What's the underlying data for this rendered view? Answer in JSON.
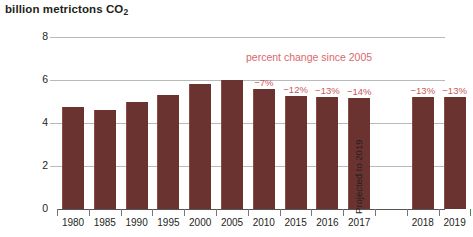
{
  "chart_data": {
    "type": "bar",
    "title": "billion metrictons CO2",
    "title_main": "billion metrictons CO",
    "title_sub": "2",
    "xlabel": "",
    "ylabel": "",
    "ylim": [
      0,
      8
    ],
    "yticks": [
      "0",
      "2",
      "4",
      "6",
      "8"
    ],
    "ytick_values": [
      0,
      2,
      4,
      6,
      8
    ],
    "grid": true,
    "legend": "none",
    "categories": [
      "1980",
      "1985",
      "1990",
      "1995",
      "2000",
      "2005",
      "2010",
      "2015",
      "2016",
      "2017",
      "2018",
      "2019"
    ],
    "values": [
      4.75,
      4.6,
      5.0,
      5.3,
      5.8,
      6.0,
      5.6,
      5.25,
      5.2,
      5.15,
      5.2,
      5.2
    ],
    "annotations": {
      "series_note": "percent change since 2005",
      "projected_note": "Projected to 2019",
      "percent_changes": [
        {
          "category": "2010",
          "label": "-7%"
        },
        {
          "category": "2015",
          "label": "-12%"
        },
        {
          "category": "2016",
          "label": "-13%"
        },
        {
          "category": "2017",
          "label": "-14%"
        },
        {
          "category": "2018",
          "label": "-13%"
        },
        {
          "category": "2019",
          "label": "-13%"
        }
      ]
    },
    "colors": {
      "bar": "#6b3330",
      "annotation_text": "#d8696d",
      "gridline": "#b9b9b9",
      "axis": "#555555",
      "projected_tick": "#2f8f4e"
    }
  }
}
